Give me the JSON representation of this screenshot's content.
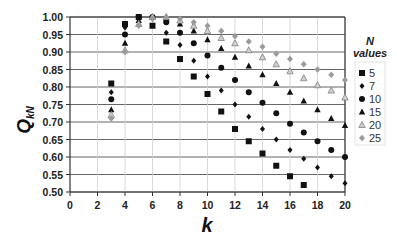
{
  "chart_data": {
    "type": "scatter",
    "title": "",
    "xlabel": "k",
    "ylabel": "Q",
    "ylabel_subscript": "kN",
    "xlim": [
      0,
      20
    ],
    "ylim": [
      0.5,
      1.0
    ],
    "x_ticks": [
      0,
      2,
      4,
      6,
      8,
      10,
      12,
      14,
      16,
      18,
      20
    ],
    "y_ticks": [
      "0.50",
      "0.55",
      "0.60",
      "0.65",
      "0.70",
      "0.75",
      "0.80",
      "0.85",
      "0.90",
      "0.95",
      "1.00"
    ],
    "grid": {
      "horizontal": true,
      "vertical": true
    },
    "legend": {
      "title_line1": "N",
      "title_line2": "values",
      "position": "right"
    },
    "series": [
      {
        "name": "5",
        "marker": "square",
        "color": "#111111",
        "x": [
          3,
          4,
          5,
          6,
          7,
          8,
          9,
          10,
          11,
          12,
          13,
          14,
          15,
          16,
          17
        ],
        "values": [
          0.81,
          0.98,
          1.0,
          0.975,
          0.93,
          0.88,
          0.83,
          0.78,
          0.73,
          0.68,
          0.645,
          0.61,
          0.575,
          0.545,
          0.52
        ]
      },
      {
        "name": "7",
        "marker": "diamond",
        "color": "#111111",
        "x": [
          3,
          4,
          5,
          6,
          7,
          8,
          9,
          10,
          11,
          12,
          13,
          14,
          15,
          16,
          17,
          18,
          19,
          20
        ],
        "values": [
          0.785,
          0.97,
          1.0,
          0.995,
          0.955,
          0.92,
          0.875,
          0.83,
          0.79,
          0.75,
          0.715,
          0.68,
          0.65,
          0.62,
          0.595,
          0.57,
          0.545,
          0.525
        ]
      },
      {
        "name": "10",
        "marker": "circle",
        "color": "#111111",
        "x": [
          3,
          4,
          5,
          6,
          7,
          8,
          9,
          10,
          11,
          12,
          13,
          14,
          15,
          16,
          17,
          18,
          19,
          20
        ],
        "values": [
          0.765,
          0.95,
          1.0,
          1.0,
          0.985,
          0.955,
          0.925,
          0.89,
          0.855,
          0.82,
          0.785,
          0.755,
          0.725,
          0.695,
          0.67,
          0.645,
          0.62,
          0.6
        ]
      },
      {
        "name": "15",
        "marker": "triangle",
        "color": "#111111",
        "x": [
          3,
          4,
          5,
          6,
          7,
          8,
          9,
          10,
          11,
          12,
          13,
          14,
          15,
          16,
          17,
          18,
          19,
          20
        ],
        "values": [
          0.735,
          0.925,
          0.99,
          1.0,
          0.995,
          0.98,
          0.96,
          0.935,
          0.91,
          0.885,
          0.86,
          0.835,
          0.81,
          0.785,
          0.76,
          0.735,
          0.71,
          0.69
        ]
      },
      {
        "name": "20",
        "marker": "triangle-open",
        "color": "#8a8a8a",
        "x": [
          3,
          4,
          5,
          6,
          7,
          8,
          9,
          10,
          11,
          12,
          13,
          14,
          15,
          16,
          17,
          18,
          19,
          20
        ],
        "values": [
          0.72,
          0.905,
          0.98,
          1.0,
          1.0,
          0.99,
          0.975,
          0.96,
          0.94,
          0.925,
          0.905,
          0.885,
          0.865,
          0.845,
          0.825,
          0.805,
          0.79,
          0.77
        ]
      },
      {
        "name": "25",
        "marker": "diamond-gray",
        "color": "#9a9a9a",
        "x": [
          3,
          4,
          5,
          6,
          7,
          8,
          9,
          10,
          11,
          12,
          13,
          14,
          15,
          16,
          17,
          18,
          19,
          20
        ],
        "values": [
          0.71,
          0.9,
          0.975,
          0.995,
          1.0,
          0.995,
          0.985,
          0.975,
          0.96,
          0.945,
          0.93,
          0.915,
          0.895,
          0.88,
          0.865,
          0.85,
          0.835,
          0.82
        ]
      }
    ]
  }
}
